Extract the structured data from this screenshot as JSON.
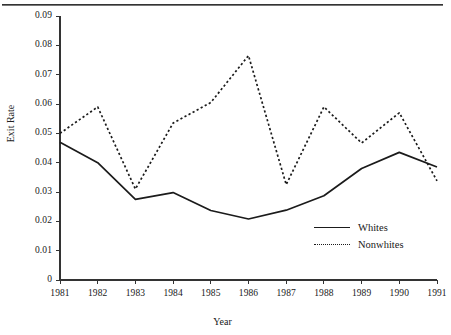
{
  "chart_data": {
    "type": "line",
    "title": "",
    "xlabel": "Year",
    "ylabel": "Exit Rate",
    "categories": [
      1981,
      1982,
      1983,
      1984,
      1985,
      1986,
      1987,
      1988,
      1989,
      1990,
      1991
    ],
    "x_tick_labels": [
      "1981",
      "1982",
      "1983",
      "1984",
      "1985",
      "1986",
      "1987",
      "1988",
      "1989",
      "1990",
      "1991"
    ],
    "y_tick_labels": [
      "0.09",
      "0.08",
      "0.07",
      "0.06",
      "0.05",
      "0.04",
      "0.03",
      "0.02",
      "0.01",
      "0"
    ],
    "y_tick_values": [
      0.09,
      0.08,
      0.07,
      0.06,
      0.05,
      0.04,
      0.03,
      0.02,
      0.01,
      0
    ],
    "ylim": [
      0,
      0.09
    ],
    "xlim": [
      1981,
      1991
    ],
    "grid": false,
    "legend_position": "inside-lower-right",
    "series": [
      {
        "name": "Whites",
        "style": "solid",
        "color": "#1b1b1b",
        "values": [
          0.047,
          0.04,
          0.0275,
          0.0298,
          0.0237,
          0.0208,
          0.0238,
          0.0287,
          0.038,
          0.0435,
          0.0385
        ]
      },
      {
        "name": "Nonwhites",
        "style": "dotted",
        "color": "#1b1b1b",
        "values": [
          0.05,
          0.059,
          0.031,
          0.0535,
          0.0605,
          0.0765,
          0.0325,
          0.059,
          0.0467,
          0.057,
          0.0338
        ]
      }
    ]
  },
  "legend": {
    "entries": [
      {
        "label": "Whites",
        "style": "solid"
      },
      {
        "label": "Nonwhites",
        "style": "dotted"
      }
    ]
  },
  "axes": {
    "y_title": "Exit Rate",
    "x_title": "Year"
  },
  "colors": {
    "line": "#1b1b1b",
    "axis": "#333333",
    "text": "#202020",
    "background": "#ffffff"
  }
}
